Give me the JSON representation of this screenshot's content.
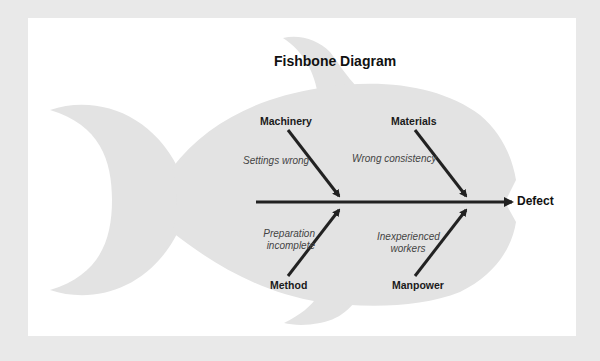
{
  "diagram": {
    "title": "Fishbone Diagram",
    "effect": "Defect",
    "categories": [
      {
        "name": "Machinery",
        "position": "top",
        "cause": "Settings wrong"
      },
      {
        "name": "Materials",
        "position": "top",
        "cause": "Wrong consistency"
      },
      {
        "name": "Method",
        "position": "bottom",
        "cause_lines": [
          "Preparation",
          "incomplete"
        ]
      },
      {
        "name": "Manpower",
        "position": "bottom",
        "cause_lines": [
          "Inexperienced",
          "workers"
        ]
      }
    ]
  },
  "colors": {
    "frame": "#e9e9e9",
    "canvas": "#ffffff",
    "fish_fill": "#e3e3e3",
    "bone": "#222222",
    "category_text": "#1a1a1a",
    "cause_text": "#444444"
  }
}
